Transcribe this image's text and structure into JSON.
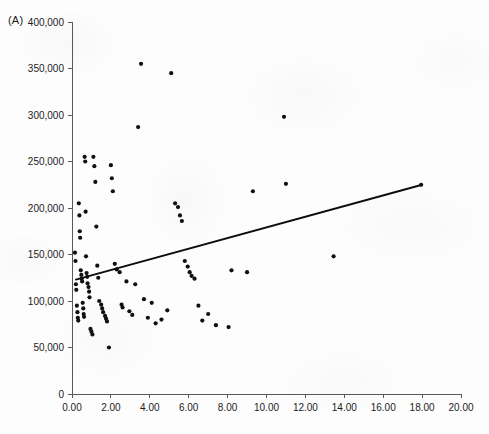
{
  "figure": {
    "panel_label": "(A)",
    "background_color": "#fdfdfd",
    "marker_color": "#101010",
    "line_color": "#0d0d0d",
    "axis_color": "#555a5e"
  },
  "chart_data": {
    "type": "scatter",
    "title": "",
    "subtitle": "",
    "xlabel": "",
    "ylabel": "",
    "xlim": [
      0,
      20
    ],
    "ylim": [
      0,
      400000
    ],
    "grid": false,
    "legend": null,
    "annotations": [
      "(A)"
    ],
    "xticks": [
      0,
      2,
      4,
      6,
      8,
      10,
      12,
      14,
      16,
      18,
      20
    ],
    "xtick_labels": [
      "0.00",
      "2.00",
      "4.00",
      "6.00",
      "8.00",
      "10.00",
      "12.00",
      "14.00",
      "16.00",
      "18.00",
      "20.00"
    ],
    "yticks": [
      0,
      50000,
      100000,
      150000,
      200000,
      250000,
      300000,
      350000,
      400000
    ],
    "ytick_labels": [
      "0",
      "50,000",
      "100,000",
      "150,000",
      "200,000",
      "250,000",
      "300,000",
      "350,000",
      "400,000"
    ],
    "series": [
      {
        "name": "observations",
        "marker": "dot",
        "x": [
          0.15,
          0.18,
          0.2,
          0.22,
          0.25,
          0.28,
          0.3,
          0.32,
          0.35,
          0.38,
          0.4,
          0.42,
          0.45,
          0.48,
          0.5,
          0.52,
          0.55,
          0.58,
          0.6,
          0.62,
          0.65,
          0.68,
          0.7,
          0.72,
          0.75,
          0.78,
          0.8,
          0.85,
          0.88,
          0.9,
          0.95,
          1.0,
          1.05,
          1.1,
          1.15,
          1.2,
          1.25,
          1.3,
          1.35,
          1.4,
          1.5,
          1.55,
          1.6,
          1.7,
          1.75,
          1.8,
          1.9,
          2.0,
          2.05,
          2.1,
          2.2,
          2.3,
          2.45,
          2.55,
          2.6,
          2.8,
          2.95,
          3.1,
          3.25,
          3.4,
          3.55,
          3.7,
          3.9,
          4.1,
          4.3,
          4.6,
          4.9,
          5.1,
          5.3,
          5.45,
          5.55,
          5.65,
          5.8,
          5.95,
          6.05,
          6.15,
          6.3,
          6.5,
          6.7,
          7.0,
          7.4,
          8.05,
          8.2,
          9.0,
          9.3,
          10.9,
          11.0,
          13.45,
          17.95
        ],
        "y": [
          152000,
          143000,
          118000,
          112000,
          95000,
          88000,
          82000,
          79000,
          205000,
          192000,
          175000,
          168000,
          133000,
          128000,
          124000,
          121000,
          98000,
          92000,
          86000,
          83000,
          255000,
          250000,
          196000,
          148000,
          130000,
          126000,
          119000,
          115000,
          110000,
          104000,
          70000,
          67000,
          64000,
          255000,
          245000,
          228000,
          180000,
          138000,
          125000,
          100000,
          96000,
          92000,
          88000,
          84000,
          81000,
          78000,
          50000,
          246000,
          232000,
          218000,
          140000,
          134000,
          131000,
          96000,
          93000,
          121000,
          89000,
          85000,
          118000,
          287000,
          355000,
          102000,
          82000,
          98000,
          76000,
          80000,
          90000,
          345000,
          205000,
          201000,
          192000,
          186000,
          143000,
          137000,
          131000,
          127000,
          124000,
          95000,
          79000,
          86000,
          74000,
          72000,
          133000,
          131000,
          218000,
          298000,
          226000,
          148000,
          225000
        ]
      }
    ],
    "fit_line": {
      "name": "linear trend",
      "x": [
        0.2,
        18.0
      ],
      "y": [
        123000,
        225000
      ]
    }
  }
}
